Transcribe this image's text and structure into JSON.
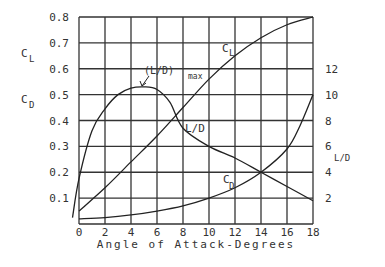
{
  "chart_data": {
    "type": "line",
    "title": "",
    "xlabel": "Angle of Attack-Degrees",
    "ylabel_left": [
      "C_L",
      "C_D"
    ],
    "ylabel_right": "L/D",
    "xlim": [
      0,
      18
    ],
    "ylim_left": [
      0,
      0.8
    ],
    "ylim_right": [
      0,
      16
    ],
    "grid": true,
    "x_ticks": [
      "0",
      "2",
      "4",
      "6",
      "8",
      "10",
      "12",
      "14",
      "16",
      "18"
    ],
    "y_left_ticks": [
      "0.1",
      "0.2",
      "0.3",
      "0.4",
      "0.5",
      "0.6",
      "0.7",
      "0.8"
    ],
    "y_right_ticks": [
      "2",
      "4",
      "6",
      "8",
      "10",
      "12"
    ],
    "annotations": [
      {
        "text": "(L/D)max",
        "x": 4.5,
        "y_right": 10.6
      },
      {
        "text": "C_L",
        "near": "CL curve at ~12°"
      },
      {
        "text": "L/D",
        "near": "L/D curve at ~8.5°"
      },
      {
        "text": "C_D",
        "near": "CD curve at ~12°"
      }
    ],
    "series": [
      {
        "name": "C_L",
        "axis": "left",
        "x": [
          0,
          2,
          4,
          6,
          8,
          10,
          12,
          14,
          16,
          18
        ],
        "values": [
          0.05,
          0.14,
          0.24,
          0.34,
          0.45,
          0.56,
          0.65,
          0.72,
          0.77,
          0.8
        ]
      },
      {
        "name": "C_D",
        "axis": "left",
        "x": [
          0,
          2,
          4,
          6,
          8,
          10,
          12,
          14,
          16,
          17,
          18
        ],
        "values": [
          0.02,
          0.025,
          0.035,
          0.05,
          0.07,
          0.1,
          0.14,
          0.2,
          0.29,
          0.38,
          0.5
        ]
      },
      {
        "name": "L/D",
        "axis": "right",
        "x": [
          -0.5,
          0,
          1,
          2,
          3,
          4,
          5,
          6,
          7,
          8,
          10,
          12,
          14,
          16,
          18
        ],
        "values": [
          0.5,
          3.5,
          7.2,
          8.9,
          10.0,
          10.5,
          10.6,
          10.4,
          9.4,
          7.4,
          6.0,
          5.1,
          4.0,
          2.9,
          1.8
        ]
      }
    ]
  },
  "labels": {
    "cl": "C",
    "cl_sub": "L",
    "cd": "C",
    "cd_sub": "D",
    "ld": "L/D",
    "ldmax": "(L/D)",
    "ldmax_sub": "max",
    "xlabel": "Angle of Attack-Degrees"
  }
}
